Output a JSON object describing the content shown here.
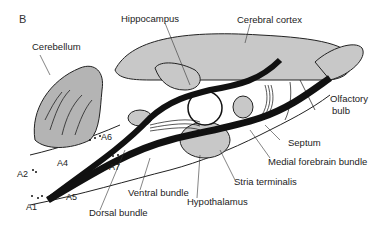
{
  "panel_label": "B",
  "labels": {
    "hippocampus": "Hippocampus",
    "cerebral_cortex": "Cerebral cortex",
    "cerebellum": "Cerebellum",
    "olfactory_bulb_line1": "Olfactory",
    "olfactory_bulb_line2": "bulb",
    "septum": "Septum",
    "medial_forebrain_bundle": "Medial forebrain bundle",
    "stria_terminalis": "Stria terminalis",
    "hypothalamus": "Hypothalamus",
    "ventral_bundle": "Ventral bundle",
    "dorsal_bundle": "Dorsal bundle",
    "a1": "A1",
    "a2": "A2",
    "a4": "A4",
    "a5": "A5",
    "a6": "A6",
    "a7": "A7"
  },
  "colors": {
    "region_fill": "#c8c8c8",
    "cerebellum_fill": "#b4b4b4",
    "tract": "#111111",
    "outline": "#222222"
  }
}
